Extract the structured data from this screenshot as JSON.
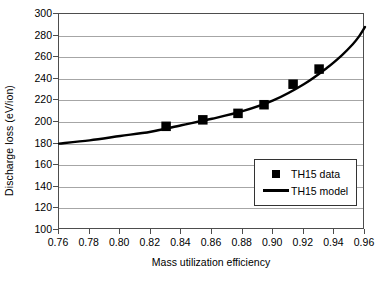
{
  "chart_data": {
    "type": "scatter",
    "title": "",
    "xlabel": "Mass utilization efficiency",
    "ylabel": "Discharge loss (eV/ion)",
    "xlim": [
      0.76,
      0.96
    ],
    "ylim": [
      100,
      300
    ],
    "xticks": [
      "0.76",
      "0.78",
      "0.80",
      "0.82",
      "0.84",
      "0.86",
      "0.88",
      "0.90",
      "0.92",
      "0.94",
      "0.96"
    ],
    "xtick_values": [
      0.76,
      0.78,
      0.8,
      0.82,
      0.84,
      0.86,
      0.88,
      0.9,
      0.92,
      0.94,
      0.96
    ],
    "yticks": [
      "100",
      "120",
      "140",
      "160",
      "180",
      "200",
      "220",
      "240",
      "260",
      "280",
      "300"
    ],
    "ytick_values": [
      100,
      120,
      140,
      160,
      180,
      200,
      220,
      240,
      260,
      280,
      300
    ],
    "grid": "horizontal",
    "legend_position": "inside-lower-right",
    "series": [
      {
        "name": "TH15 data",
        "type": "scatter",
        "marker": "square",
        "color": "#000000",
        "x": [
          0.83,
          0.854,
          0.877,
          0.894,
          0.913,
          0.93
        ],
        "y": [
          196,
          202,
          208,
          216,
          235,
          249
        ]
      },
      {
        "name": "TH15 model",
        "type": "line",
        "color": "#000000",
        "x": [
          0.76,
          0.78,
          0.8,
          0.82,
          0.84,
          0.86,
          0.88,
          0.9,
          0.92,
          0.935,
          0.945,
          0.952,
          0.956,
          0.96
        ],
        "y": [
          180,
          183,
          187,
          191,
          197,
          203,
          210,
          220,
          235,
          250,
          262,
          272,
          279,
          288
        ]
      }
    ]
  },
  "legend": {
    "entries": [
      {
        "label": "TH15 data",
        "swatch": "square-marker"
      },
      {
        "label": "TH15 model",
        "swatch": "line-segment"
      }
    ]
  }
}
